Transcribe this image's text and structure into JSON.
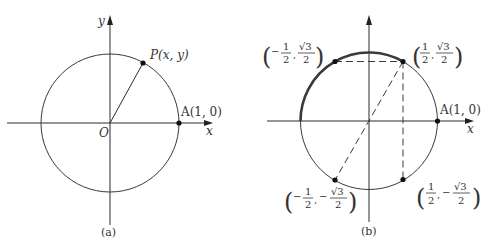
{
  "figure_a": {
    "caption": "(a)",
    "x_axis_label": "x",
    "y_axis_label": "y",
    "origin_label": "O",
    "point_p_label": "P(x, y)",
    "point_a_label": "A(1, 0)"
  },
  "figure_b": {
    "caption": "(b)",
    "x_axis_label": "x",
    "point_a_label": "A(1, 0)",
    "points": [
      {
        "name": "upper-left",
        "x_sign": "−",
        "x_num": "1",
        "x_den": "2",
        "y_sign": "",
        "y_num": "√3",
        "y_den": "2"
      },
      {
        "name": "upper-right",
        "x_sign": "",
        "x_num": "1",
        "x_den": "2",
        "y_sign": "",
        "y_num": "√3",
        "y_den": "2"
      },
      {
        "name": "lower-left",
        "x_sign": "−",
        "x_num": "1",
        "x_den": "2",
        "y_sign": "−",
        "y_num": "√3",
        "y_den": "2"
      },
      {
        "name": "lower-right",
        "x_sign": "",
        "x_num": "1",
        "x_den": "2",
        "y_sign": "−",
        "y_num": "√3",
        "y_den": "2"
      }
    ]
  }
}
